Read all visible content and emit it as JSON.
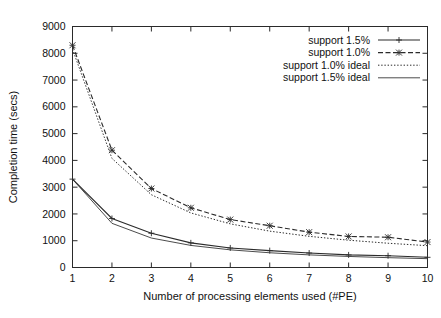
{
  "chart_data": {
    "type": "line",
    "title": "",
    "xlabel": "Number of processing elements used (#PE)",
    "ylabel": "Completion time (secs)",
    "x": [
      1,
      2,
      3,
      4,
      5,
      6,
      7,
      8,
      9,
      10
    ],
    "xlim": [
      1,
      10
    ],
    "ylim": [
      0,
      9000
    ],
    "xticks": [
      "1",
      "2",
      "3",
      "4",
      "5",
      "6",
      "7",
      "8",
      "9",
      "10"
    ],
    "yticks": [
      "0",
      "1000",
      "2000",
      "3000",
      "4000",
      "5000",
      "6000",
      "7000",
      "8000",
      "9000"
    ],
    "grid": false,
    "legend_position": "top-right",
    "series": [
      {
        "name": "support 1.5%",
        "style": "solid",
        "marker": "plus",
        "color": "#2b2b2b",
        "values": [
          3300,
          1830,
          1280,
          920,
          730,
          630,
          540,
          470,
          440,
          380
        ]
      },
      {
        "name": "support 1.0%",
        "style": "dashed",
        "marker": "cross",
        "color": "#2b2b2b",
        "values": [
          8300,
          4380,
          2950,
          2230,
          1790,
          1560,
          1320,
          1160,
          1130,
          950
        ]
      },
      {
        "name": "support 1.0% ideal",
        "style": "dotted",
        "marker": "none",
        "color": "#2b2b2b",
        "values": [
          8150,
          4075,
          2717,
          2038,
          1630,
          1358,
          1164,
          1019,
          906,
          815
        ]
      },
      {
        "name": "support 1.5% ideal",
        "style": "solid-thin",
        "marker": "none",
        "color": "#555555",
        "values": [
          3300,
          1650,
          1100,
          825,
          660,
          550,
          471,
          413,
          367,
          330
        ]
      }
    ]
  },
  "axes": {
    "x_title": "Number of processing elements used (#PE)",
    "y_title": "Completion time (secs)"
  },
  "legend": {
    "entries": [
      {
        "label": "support 1.5%"
      },
      {
        "label": "support 1.0%"
      },
      {
        "label": "support 1.0% ideal"
      },
      {
        "label": "support 1.5% ideal"
      }
    ]
  }
}
